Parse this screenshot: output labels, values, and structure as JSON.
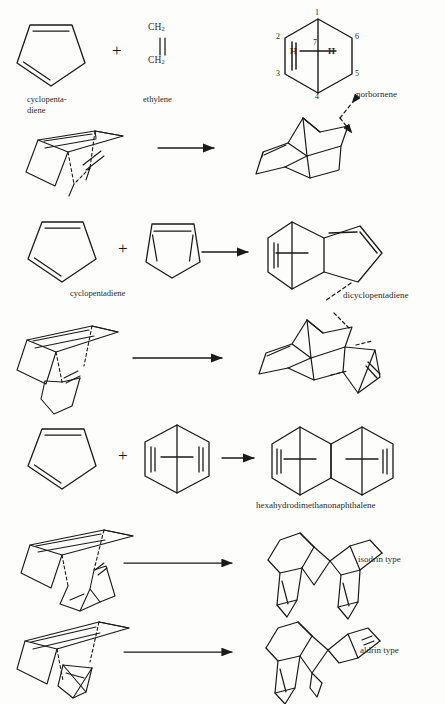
{
  "document": {
    "kind": "chemistry-reaction-scheme",
    "topic": "Diels-Alder reactions of cyclopentadiene",
    "background_color": "#fdfdfb",
    "ink_color": "#1a1a1a"
  },
  "symbols": {
    "plus": "+",
    "double_bond_vertical": "‖",
    "arrow": "reaction-arrow"
  },
  "reactions": [
    {
      "id": "r1",
      "reactant_a": {
        "label_line1": "cyclopenta-",
        "label_line2": "diene",
        "structure": "cyclopentadiene-ring"
      },
      "reactant_b": {
        "label": "ethylene",
        "formula_top": "CH2",
        "formula_bottom": "CH2",
        "structure": "ethylene-formula"
      },
      "product": {
        "label": "norbornene",
        "structure": "norbornene-numbered-hexagon",
        "ring_numbers": [
          "1",
          "2",
          "3",
          "4",
          "5",
          "6",
          "7"
        ],
        "bridge_atoms": [
          "H",
          "H"
        ]
      }
    },
    {
      "id": "r1-3d",
      "reactant": {
        "structure": "cyclopentadiene-ethylene-approach-3d"
      },
      "product": {
        "structure": "norbornene-3d"
      }
    },
    {
      "id": "r2",
      "reactant_a": {
        "label": "cyclopentadiene",
        "structure": "cyclopentadiene-ring"
      },
      "reactant_b": {
        "label": "",
        "structure": "cyclopentadiene-ring-flat"
      },
      "product": {
        "label": "dicyclopentadiene",
        "structure": "dicyclopentadiene-fused"
      }
    },
    {
      "id": "r2-3d",
      "reactant": {
        "structure": "two-cyclopentadiene-approach-3d"
      },
      "product": {
        "structure": "dicyclopentadiene-3d"
      }
    },
    {
      "id": "r3",
      "reactant_a": {
        "label": "",
        "structure": "cyclopentadiene-ring"
      },
      "reactant_b": {
        "label": "",
        "structure": "norbornadiene-bridged-hexagon"
      },
      "product": {
        "label": "hexahydrodimethanonaphthalene",
        "structure": "bis-methano-fused-bicyclic"
      }
    },
    {
      "id": "r4",
      "reactant": {
        "structure": "endo-approach-3d"
      },
      "product": {
        "label": "isodrin type",
        "structure": "isodrin-3d"
      }
    },
    {
      "id": "r5",
      "reactant": {
        "structure": "exo-approach-3d"
      },
      "product": {
        "label": "aldrin type",
        "structure": "aldrin-3d"
      }
    }
  ],
  "footer": {
    "cut_caption": ""
  }
}
